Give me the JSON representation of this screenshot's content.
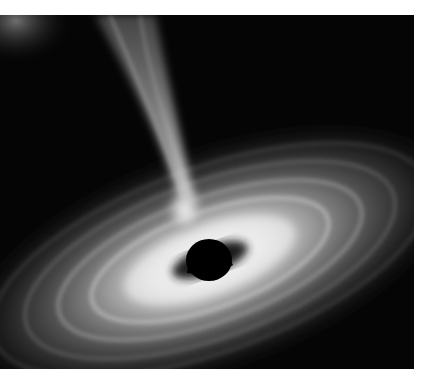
{
  "image": {
    "subject": "black hole with accretion disk and relativistic jet",
    "palette": {
      "background": "#050505",
      "disk_glow": "#f4f4f4",
      "jet": "#d8d8d8",
      "hole": "#000000",
      "margin": "#ffffff"
    }
  }
}
